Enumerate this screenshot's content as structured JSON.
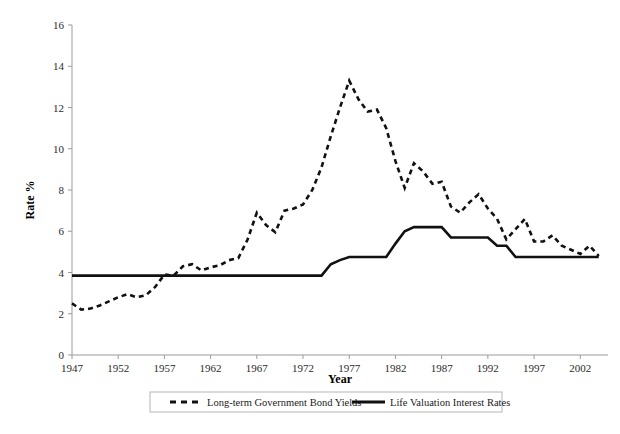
{
  "chart_data": {
    "type": "line",
    "title": "",
    "xlabel": "Year",
    "ylabel": "Rate %",
    "xlim": [
      1947,
      2005
    ],
    "ylim": [
      0,
      16
    ],
    "yticks": [
      0,
      2,
      4,
      6,
      8,
      10,
      12,
      14,
      16
    ],
    "xticks": [
      1947,
      1952,
      1957,
      1962,
      1967,
      1972,
      1977,
      1982,
      1987,
      1992,
      1997,
      2002
    ],
    "grid": false,
    "legend_position": "bottom",
    "x": [
      1947,
      1948,
      1949,
      1950,
      1951,
      1952,
      1953,
      1954,
      1955,
      1956,
      1957,
      1958,
      1959,
      1960,
      1961,
      1962,
      1963,
      1964,
      1965,
      1966,
      1967,
      1968,
      1969,
      1970,
      1971,
      1972,
      1973,
      1974,
      1975,
      1976,
      1977,
      1978,
      1979,
      1980,
      1981,
      1982,
      1983,
      1984,
      1985,
      1986,
      1987,
      1988,
      1989,
      1990,
      1991,
      1992,
      1993,
      1994,
      1995,
      1996,
      1997,
      1998,
      1999,
      2000,
      2001,
      2002,
      2003,
      2004
    ],
    "series": [
      {
        "name": "Long-term Government Bond Yields",
        "style": "dashed",
        "color": "#111111",
        "values": [
          2.5,
          2.2,
          2.25,
          2.4,
          2.6,
          2.8,
          2.95,
          2.8,
          2.9,
          3.3,
          3.9,
          3.85,
          4.3,
          4.4,
          4.1,
          4.25,
          4.35,
          4.6,
          4.7,
          5.6,
          6.9,
          6.3,
          5.95,
          7.0,
          7.1,
          7.3,
          8.0,
          9.1,
          10.6,
          12.0,
          13.3,
          12.4,
          11.8,
          11.9,
          11.0,
          9.4,
          8.1,
          9.3,
          8.9,
          8.3,
          8.4,
          7.2,
          6.9,
          7.4,
          7.8,
          7.1,
          6.6,
          5.6,
          6.1,
          6.6,
          5.5,
          5.5,
          5.8,
          5.3,
          5.1,
          4.9,
          5.3,
          4.8
        ]
      },
      {
        "name": "Life Valuation Interest Rates",
        "style": "solid",
        "color": "#111111",
        "values": [
          3.85,
          3.85,
          3.85,
          3.85,
          3.85,
          3.85,
          3.85,
          3.85,
          3.85,
          3.85,
          3.85,
          3.85,
          3.85,
          3.85,
          3.85,
          3.85,
          3.85,
          3.85,
          3.85,
          3.85,
          3.85,
          3.85,
          3.85,
          3.85,
          3.85,
          3.85,
          3.85,
          3.85,
          4.4,
          4.6,
          4.75,
          4.75,
          4.75,
          4.75,
          4.75,
          5.4,
          6.0,
          6.2,
          6.2,
          6.2,
          6.2,
          5.7,
          5.7,
          5.7,
          5.7,
          5.7,
          5.3,
          5.3,
          4.75,
          4.75,
          4.75,
          4.75,
          4.75,
          4.75,
          4.75,
          4.75,
          4.75,
          4.75
        ]
      }
    ],
    "legend": [
      {
        "label": "Long-term Government Bond Yields",
        "style": "dashed"
      },
      {
        "label": "Life Valuation Interest Rates",
        "style": "solid"
      }
    ]
  }
}
